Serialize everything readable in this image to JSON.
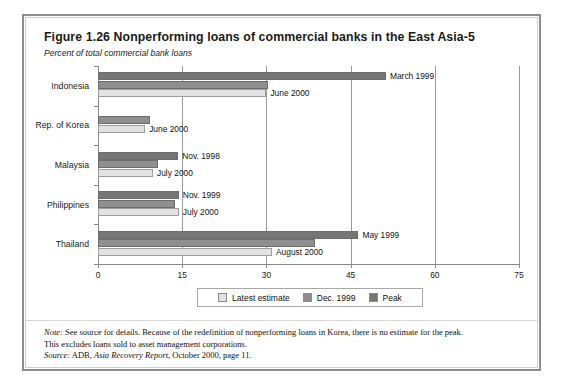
{
  "figure": {
    "title": "Figure 1.26  Nonperforming loans of commercial banks in the East Asia-5",
    "subtitle": "Percent of total commercial bank loans"
  },
  "notes": {
    "note_prefix": "Note:",
    "note_line1": " See source for details. Because of the redefinition of nonperforming loans in Korea, there is no estimate for the peak.",
    "note_line2": "This excludes loans sold to asset management corporations.",
    "source_prefix": "Source:",
    "source_text_a": " ADB, ",
    "source_italic": "Asia Recovery Report",
    "source_text_b": ", October 2000, page 11."
  },
  "legend": {
    "items": [
      {
        "label": "Latest estimate",
        "color": "#e2e2e2",
        "key": "latest"
      },
      {
        "label": "Dec. 1999",
        "color": "#8f8f8f",
        "key": "dec"
      },
      {
        "label": "Peak",
        "color": "#767676",
        "key": "peak"
      }
    ]
  },
  "chart_data": {
    "type": "bar",
    "orientation": "horizontal",
    "title": "Figure 1.26  Nonperforming loans of commercial banks in the East Asia-5",
    "subtitle": "Percent of total commercial bank loans",
    "xlabel": "",
    "ylabel": "",
    "xlim": [
      0,
      75
    ],
    "xticks": [
      0,
      15,
      30,
      45,
      60,
      75
    ],
    "xticklabels": [
      "0",
      "15",
      "30",
      "45",
      "60",
      "75"
    ],
    "grid": true,
    "legend_position": "bottom",
    "categories": [
      "Indonesia",
      "Rep. of Korea",
      "Malaysia",
      "Philippines",
      "Thailand"
    ],
    "series": [
      {
        "name": "Peak",
        "color": "#767676",
        "values": [
          51.3,
          null,
          14.3,
          14.4,
          46.4
        ]
      },
      {
        "name": "Dec. 1999",
        "color": "#8f8f8f",
        "values": [
          30.3,
          9.3,
          10.7,
          13.7,
          38.7
        ]
      },
      {
        "name": "Latest estimate",
        "color": "#e2e2e2",
        "values": [
          30.0,
          8.4,
          9.8,
          14.4,
          31.0
        ]
      }
    ],
    "annotations": [
      {
        "category": "Indonesia",
        "series": "Peak",
        "text": "March 1999",
        "value": 51.3
      },
      {
        "category": "Indonesia",
        "series": "Latest estimate",
        "text": "June 2000",
        "value": 30.0
      },
      {
        "category": "Rep. of Korea",
        "series": "Latest estimate",
        "text": "June 2000",
        "value": 8.4
      },
      {
        "category": "Malaysia",
        "series": "Peak",
        "text": "Nov. 1998",
        "value": 14.3
      },
      {
        "category": "Malaysia",
        "series": "Latest estimate",
        "text": "July 2000",
        "value": 9.8
      },
      {
        "category": "Philippines",
        "series": "Peak",
        "text": "Nov. 1999",
        "value": 14.4
      },
      {
        "category": "Philippines",
        "series": "Latest estimate",
        "text": "July 2000",
        "value": 14.4
      },
      {
        "category": "Thailand",
        "series": "Peak",
        "text": "May 1999",
        "value": 46.4
      },
      {
        "category": "Thailand",
        "series": "Latest estimate",
        "text": "August 2000",
        "value": 31.0
      }
    ]
  }
}
